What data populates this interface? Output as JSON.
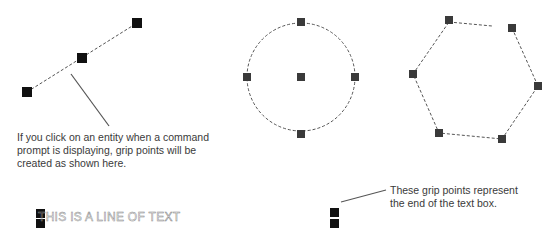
{
  "figure": {
    "callouts": {
      "entity_grips": {
        "lines": [
          "If you click on an entity when a command",
          "prompt is displaying, grip points will be",
          "created as shown here."
        ]
      },
      "text_grips": {
        "lines": [
          "These grip points represent",
          "the end of the text box."
        ]
      }
    },
    "sample_text": "THIS IS A LINE OF TEXT",
    "colors": {
      "grip_line": "#111111",
      "grip_shape": "#3a3a3a",
      "dashed": "#555555",
      "leader": "#555555",
      "note_text": "#3a3a3a"
    },
    "entities": [
      {
        "type": "line",
        "grips": [
          [
            27,
            92
          ],
          [
            82,
            58
          ],
          [
            137,
            23
          ]
        ]
      },
      {
        "type": "circle",
        "center": [
          301,
          77
        ],
        "radius": 54,
        "grips": [
          [
            301,
            22
          ],
          [
            247,
            77
          ],
          [
            301,
            77
          ],
          [
            355,
            77
          ],
          [
            301,
            133
          ]
        ]
      },
      {
        "type": "polygon",
        "sides": 6,
        "grips": [
          [
            449,
            20
          ],
          [
            511,
            28
          ],
          [
            538,
            86
          ],
          [
            502,
            139
          ],
          [
            439,
            133
          ],
          [
            413,
            74
          ]
        ]
      },
      {
        "type": "text",
        "grips": [
          [
            40,
            213
          ],
          [
            40,
            225
          ],
          [
            333,
            213
          ],
          [
            333,
            225
          ]
        ]
      }
    ]
  }
}
